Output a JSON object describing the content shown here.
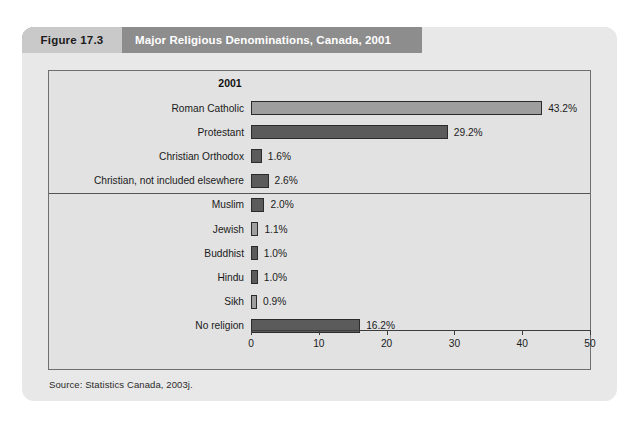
{
  "figure": {
    "number_label": "Figure 17.3",
    "title": "Major Religious Denominations, Canada, 2001",
    "source": "Source: Statistics Canada, 2003j.",
    "header_band_color": "#8d8d8d",
    "number_tab_color": "#c9c9c9",
    "panel_background": "#e2e2e2"
  },
  "chart_data": {
    "type": "bar",
    "orientation": "horizontal",
    "title": "Major Religious Denominations, Canada, 2001",
    "column_header": "2001",
    "xlabel": "",
    "ylabel": "",
    "xlim": [
      0,
      50
    ],
    "grid": false,
    "legend": "none",
    "tick_labels": [
      "0",
      "10",
      "20",
      "30",
      "40",
      "50"
    ],
    "ticks": [
      0,
      10,
      20,
      30,
      40,
      50
    ],
    "categories": [
      "Roman Catholic",
      "Protestant",
      "Christian Orthodox",
      "Christian, not included elsewhere",
      "Muslim",
      "Jewish",
      "Buddhist",
      "Hindu",
      "Sikh",
      "No religion"
    ],
    "values": [
      43.2,
      29.2,
      1.6,
      2.6,
      2.0,
      1.1,
      1.0,
      1.0,
      0.9,
      16.2
    ],
    "value_labels": [
      "43.2%",
      "29.2%",
      "1.6%",
      "2.6%",
      "2.0%",
      "1.1%",
      "1.0%",
      "1.0%",
      "0.9%",
      "16.2%"
    ],
    "bar_shades": [
      "light",
      "dark",
      "dark",
      "dark",
      "dark",
      "light",
      "dark",
      "dark",
      "light",
      "dark"
    ],
    "bar_colors": {
      "light": "#9e9e9e",
      "dark": "#5b5b5b"
    },
    "separator_after_category_index": 3
  }
}
